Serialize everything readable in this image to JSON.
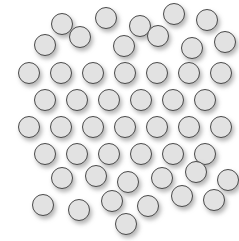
{
  "figure": {
    "name": "circle-scatter-field",
    "width": 239,
    "height": 241,
    "background_color": "#ffffff"
  },
  "marker_style": {
    "shape": "circle",
    "diameter": 22,
    "fill_color": "#e2e2e2",
    "border_color": "#4a4a4a",
    "border_width": 1.5,
    "shadow_color": "#787878",
    "shadow_offset_x": 2,
    "shadow_offset_y": 3,
    "shadow_blur": 4
  },
  "chart_data": {
    "type": "scatter",
    "title": "",
    "subtitle": "",
    "xlabel": "",
    "ylabel": "",
    "grid": false,
    "legend": null,
    "axis_visible": false,
    "tick_labels": [],
    "annotations": [],
    "xlim": [
      0,
      239
    ],
    "ylim": [
      0,
      241
    ],
    "point_count": 50,
    "marker_diameter": 22,
    "points": [
      {
        "x": 62,
        "y": 24
      },
      {
        "x": 106,
        "y": 18
      },
      {
        "x": 140,
        "y": 26
      },
      {
        "x": 174,
        "y": 14
      },
      {
        "x": 207,
        "y": 20
      },
      {
        "x": 45,
        "y": 45
      },
      {
        "x": 80,
        "y": 37
      },
      {
        "x": 124,
        "y": 46
      },
      {
        "x": 158,
        "y": 36
      },
      {
        "x": 192,
        "y": 48
      },
      {
        "x": 225,
        "y": 42
      },
      {
        "x": 29,
        "y": 73
      },
      {
        "x": 61,
        "y": 73
      },
      {
        "x": 93,
        "y": 73
      },
      {
        "x": 125,
        "y": 73
      },
      {
        "x": 157,
        "y": 73
      },
      {
        "x": 189,
        "y": 73
      },
      {
        "x": 221,
        "y": 73
      },
      {
        "x": 45,
        "y": 100
      },
      {
        "x": 77,
        "y": 100
      },
      {
        "x": 109,
        "y": 100
      },
      {
        "x": 141,
        "y": 100
      },
      {
        "x": 173,
        "y": 100
      },
      {
        "x": 205,
        "y": 100
      },
      {
        "x": 29,
        "y": 127
      },
      {
        "x": 61,
        "y": 127
      },
      {
        "x": 93,
        "y": 127
      },
      {
        "x": 125,
        "y": 127
      },
      {
        "x": 157,
        "y": 127
      },
      {
        "x": 189,
        "y": 127
      },
      {
        "x": 221,
        "y": 127
      },
      {
        "x": 45,
        "y": 154
      },
      {
        "x": 77,
        "y": 154
      },
      {
        "x": 109,
        "y": 154
      },
      {
        "x": 141,
        "y": 154
      },
      {
        "x": 173,
        "y": 154
      },
      {
        "x": 205,
        "y": 154
      },
      {
        "x": 62,
        "y": 178
      },
      {
        "x": 96,
        "y": 176
      },
      {
        "x": 128,
        "y": 182
      },
      {
        "x": 162,
        "y": 178
      },
      {
        "x": 196,
        "y": 172
      },
      {
        "x": 228,
        "y": 180
      },
      {
        "x": 43,
        "y": 205
      },
      {
        "x": 79,
        "y": 210
      },
      {
        "x": 112,
        "y": 201
      },
      {
        "x": 148,
        "y": 206
      },
      {
        "x": 182,
        "y": 196
      },
      {
        "x": 214,
        "y": 200
      },
      {
        "x": 126,
        "y": 224
      }
    ]
  }
}
